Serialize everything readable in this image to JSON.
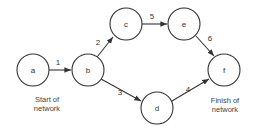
{
  "diagram": {
    "type": "activity-on-arrow network",
    "nodes": [
      {
        "id": "a",
        "label": "a"
      },
      {
        "id": "b",
        "label": "b"
      },
      {
        "id": "c",
        "label": "c"
      },
      {
        "id": "d",
        "label": "d"
      },
      {
        "id": "e",
        "label": "e"
      },
      {
        "id": "f",
        "label": "f"
      }
    ],
    "edges": [
      {
        "from": "a",
        "to": "b",
        "label": "1"
      },
      {
        "from": "b",
        "to": "c",
        "label": "2"
      },
      {
        "from": "b",
        "to": "d",
        "label": "3"
      },
      {
        "from": "d",
        "to": "f",
        "label": "4"
      },
      {
        "from": "c",
        "to": "e",
        "label": "5"
      },
      {
        "from": "e",
        "to": "f",
        "label": "6"
      }
    ],
    "captions": {
      "start_line1": "Start of",
      "start_line2": "network",
      "finish_line1": "Finish of",
      "finish_line2": "network"
    }
  }
}
